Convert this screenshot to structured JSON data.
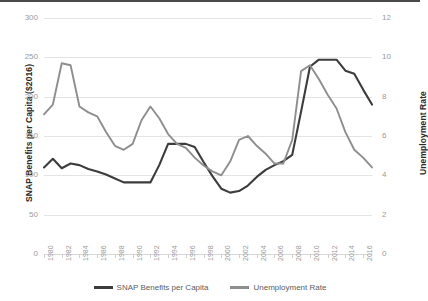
{
  "chart_data": {
    "type": "line",
    "title": "",
    "subtitle": "",
    "xlabel": "",
    "grid": true,
    "legend_position": "bottom",
    "x": [
      1980,
      1981,
      1982,
      1983,
      1984,
      1985,
      1986,
      1987,
      1988,
      1989,
      1990,
      1991,
      1992,
      1993,
      1994,
      1995,
      1996,
      1997,
      1998,
      1999,
      2000,
      2001,
      2002,
      2003,
      2004,
      2005,
      2006,
      2007,
      2008,
      2009,
      2010,
      2011,
      2012,
      2013,
      2014,
      2015,
      2016,
      2017
    ],
    "x_tick_labels": [
      "1980",
      "1982",
      "1984",
      "1986",
      "1988",
      "1990",
      "1992",
      "1994",
      "1996",
      "1998",
      "2000",
      "2002",
      "2004",
      "2006",
      "2008",
      "2010",
      "2012",
      "2014",
      "2016"
    ],
    "axes": [
      {
        "id": "left",
        "label": "SNAP Benefits per Capita ($2016)",
        "ticks": [
          "0",
          "50",
          "100",
          "150",
          "200",
          "250",
          "300"
        ],
        "tick_values": [
          0,
          50,
          100,
          150,
          200,
          250,
          300
        ],
        "lim": [
          0,
          300
        ]
      },
      {
        "id": "right",
        "label": "Unemployment Rate",
        "ticks": [
          "0",
          "2",
          "4",
          "6",
          "8",
          "10",
          "12"
        ],
        "tick_values": [
          0,
          2,
          4,
          6,
          8,
          10,
          12
        ],
        "lim": [
          0,
          12
        ]
      }
    ],
    "series": [
      {
        "name": "SNAP Benefits per Capita",
        "axis": "left",
        "color": "#3c3c3c",
        "width": 2.1,
        "values": [
          110,
          121,
          109,
          115,
          113,
          108,
          105,
          101,
          96,
          91,
          91,
          91,
          91,
          113,
          140,
          140,
          140,
          136,
          117,
          99,
          83,
          78,
          80,
          87,
          98,
          107,
          113,
          118,
          126,
          181,
          238,
          247,
          247,
          247,
          233,
          229,
          209,
          190
        ]
      },
      {
        "name": "Unemployment Rate",
        "axis": "right",
        "color": "#8e8e8e",
        "width": 1.9,
        "values": [
          7.1,
          7.6,
          9.7,
          9.6,
          7.5,
          7.2,
          7.0,
          6.2,
          5.5,
          5.3,
          5.6,
          6.8,
          7.5,
          6.9,
          6.1,
          5.6,
          5.4,
          4.9,
          4.5,
          4.2,
          4.0,
          4.7,
          5.8,
          6.0,
          5.5,
          5.1,
          4.6,
          4.6,
          5.8,
          9.3,
          9.6,
          8.9,
          8.1,
          7.4,
          6.2,
          5.3,
          4.9,
          4.4
        ]
      }
    ],
    "legend": [
      {
        "label": "SNAP Benefits per Capita",
        "color": "#3c3c3c"
      },
      {
        "label": "Unemployment Rate",
        "color": "#8e8e8e"
      }
    ],
    "colors": {
      "snap_line": "#3c3c3c",
      "unemployment_line": "#8e8e8e",
      "gridline": "#e4e4e4",
      "tick_text": "#9a9a9a",
      "axis_title_text": "#2b2b2b",
      "background": "#ffffff"
    }
  }
}
